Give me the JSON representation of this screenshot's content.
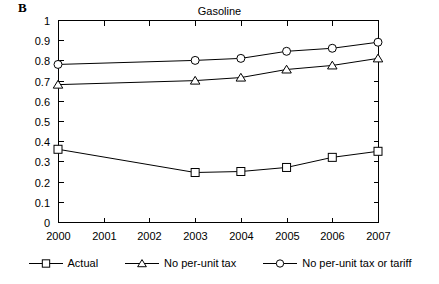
{
  "panel_label": "B",
  "chart_data": {
    "type": "line",
    "title": "Gasoline",
    "xlabel": "",
    "ylabel": "",
    "xlim": [
      2000,
      2007
    ],
    "ylim": [
      0,
      1
    ],
    "grid": false,
    "legend_position": "bottom",
    "categories": [
      "2000",
      "2001",
      "2002",
      "2003",
      "2004",
      "2005",
      "2006",
      "2007"
    ],
    "x_tick_labels": [
      "2000",
      "2001",
      "2002",
      "2003",
      "2004",
      "2005",
      "2006",
      "2007"
    ],
    "y_tick_labels": [
      "0",
      "0.1",
      "0.2",
      "0.3",
      "0.4",
      "0.5",
      "0.6",
      "0.7",
      "0.8",
      "0.9",
      "1"
    ],
    "y_ticks": [
      0,
      0.1,
      0.2,
      0.3,
      0.4,
      0.5,
      0.6,
      0.7,
      0.8,
      0.9,
      1
    ],
    "series": [
      {
        "name": "Actual",
        "marker": "square",
        "x": [
          2000,
          2003,
          2004,
          2005,
          2006,
          2007
        ],
        "values": [
          0.36,
          0.245,
          0.25,
          0.27,
          0.32,
          0.35
        ]
      },
      {
        "name": "No per-unit tax",
        "marker": "triangle",
        "x": [
          2000,
          2003,
          2004,
          2005,
          2006,
          2007
        ],
        "values": [
          0.68,
          0.7,
          0.715,
          0.755,
          0.775,
          0.81
        ]
      },
      {
        "name": "No per-unit tax or tariff",
        "marker": "circle",
        "x": [
          2000,
          2003,
          2004,
          2005,
          2006,
          2007
        ],
        "values": [
          0.78,
          0.8,
          0.81,
          0.845,
          0.86,
          0.89
        ]
      }
    ]
  },
  "legend": {
    "items": [
      {
        "label": "Actual",
        "marker": "square"
      },
      {
        "label": "No per-unit tax",
        "marker": "triangle"
      },
      {
        "label": "No per-unit tax or tariff",
        "marker": "circle"
      }
    ]
  }
}
